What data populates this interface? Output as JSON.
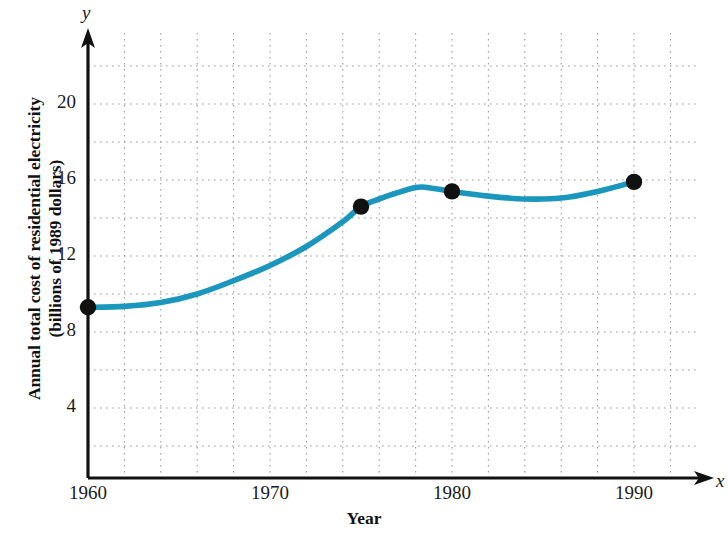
{
  "chart_data": {
    "type": "line",
    "title": "",
    "subtitle": "",
    "xlabel": "Year",
    "ylabel": "Annual total cost of residential electricity (billions of 1989 dollars)",
    "ylabel_line1": "Annual total cost of residential electricity",
    "ylabel_line2": "(billions of 1989 dollars)",
    "x_axis_variable": "x",
    "y_axis_variable": "y",
    "xlim": [
      1960,
      1994
    ],
    "ylim": [
      0,
      23
    ],
    "xticks": [
      1960,
      1970,
      1980,
      1990
    ],
    "xtick_labels": [
      "1960",
      "1970",
      "1980",
      "1990"
    ],
    "yticks": [
      4,
      8,
      12,
      16,
      20
    ],
    "ytick_labels": [
      "4",
      "8",
      "12",
      "16",
      "20"
    ],
    "grid": true,
    "grid_style": "dotted",
    "grid_x_step": 2,
    "grid_y_step": 2,
    "legend": false,
    "legend_position": "none",
    "line_color": "#1b96bd",
    "marker_color": "#111111",
    "series": [
      {
        "name": "Annual total cost of residential electricity",
        "marked_points": [
          {
            "x": 1960,
            "y": 9.3
          },
          {
            "x": 1975,
            "y": 14.6
          },
          {
            "x": 1980,
            "y": 15.4
          },
          {
            "x": 1990,
            "y": 15.9
          }
        ],
        "curve_points": [
          {
            "x": 1960,
            "y": 9.3
          },
          {
            "x": 1962,
            "y": 9.35
          },
          {
            "x": 1964,
            "y": 9.55
          },
          {
            "x": 1966,
            "y": 10.0
          },
          {
            "x": 1968,
            "y": 10.7
          },
          {
            "x": 1970,
            "y": 11.5
          },
          {
            "x": 1972,
            "y": 12.5
          },
          {
            "x": 1974,
            "y": 13.8
          },
          {
            "x": 1975,
            "y": 14.6
          },
          {
            "x": 1976,
            "y": 15.0
          },
          {
            "x": 1978,
            "y": 15.6
          },
          {
            "x": 1979,
            "y": 15.55
          },
          {
            "x": 1980,
            "y": 15.4
          },
          {
            "x": 1982,
            "y": 15.15
          },
          {
            "x": 1984,
            "y": 15.0
          },
          {
            "x": 1986,
            "y": 15.05
          },
          {
            "x": 1988,
            "y": 15.4
          },
          {
            "x": 1990,
            "y": 15.9
          }
        ]
      }
    ]
  }
}
